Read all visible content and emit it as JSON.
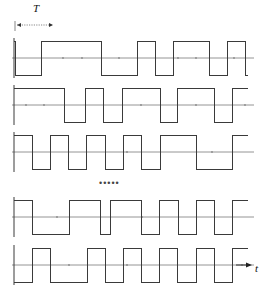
{
  "figure": {
    "name": "square-wave-timing-diagram",
    "period_label": "T",
    "time_axis_label": "t",
    "ellipsis": "•••••",
    "stroke_color": "#3a3a3a",
    "axis_color": "#7a7a7a",
    "background": "#ffffff",
    "x_start": 14,
    "x_end": 248,
    "period_px": 18,
    "amplitude_px": 17
  },
  "chart_data": {
    "type": "line",
    "title": "",
    "xlabel": "t",
    "ylabel": "",
    "grid": false,
    "legend": null,
    "annotations": [
      {
        "text": "T",
        "x": 36,
        "y": 8,
        "kind": "period-marker"
      },
      {
        "text": "•••••",
        "x": 110,
        "y": 185,
        "kind": "continuation"
      },
      {
        "text": "t",
        "x": 258,
        "y": 266,
        "kind": "axis-label"
      }
    ],
    "series": [
      {
        "name": "waveform-1",
        "baseline_y": 58,
        "start_level": 1,
        "transitions": [
          14,
          15,
          41,
          101,
          137,
          155,
          173,
          209,
          227,
          245
        ],
        "levels": [
          1,
          -1,
          1,
          -1,
          1,
          -1,
          1,
          -1,
          1,
          -1
        ],
        "axis_dots_x": [
          63,
          82,
          119,
          178,
          196,
          234
        ]
      },
      {
        "name": "waveform-2",
        "baseline_y": 105,
        "start_level": 1,
        "transitions": [
          14,
          64,
          85,
          103,
          122,
          160,
          177,
          214,
          232
        ],
        "levels": [
          1,
          -1,
          1,
          -1,
          1,
          -1,
          1,
          -1,
          1
        ],
        "axis_dots_x": [
          26,
          44,
          141,
          196,
          245
        ]
      },
      {
        "name": "waveform-3",
        "baseline_y": 152,
        "start_level": 1,
        "transitions": [
          14,
          32,
          50,
          68,
          86,
          105,
          123,
          141,
          160,
          196,
          232
        ],
        "levels": [
          1,
          -1,
          1,
          -1,
          1,
          -1,
          1,
          -1,
          1,
          -1,
          1
        ],
        "axis_dots_x": [
          127,
          212
        ]
      },
      {
        "name": "waveform-4",
        "baseline_y": 217,
        "start_level": 1,
        "transitions": [
          14,
          32,
          69,
          100,
          110,
          141,
          159,
          178,
          196,
          214,
          232
        ],
        "levels": [
          1,
          -1,
          1,
          -1,
          1,
          -1,
          1,
          -1,
          1,
          -1,
          1
        ],
        "axis_dots_x": [
          57,
          142
        ]
      },
      {
        "name": "waveform-5",
        "baseline_y": 265,
        "start_level": -1,
        "transitions": [
          14,
          32,
          50,
          87,
          105,
          123,
          141,
          159,
          177,
          196,
          214,
          232
        ],
        "levels": [
          -1,
          1,
          -1,
          1,
          -1,
          1,
          -1,
          1,
          -1,
          1,
          -1,
          1
        ],
        "axis_dots_x": [
          69,
          127,
          242
        ]
      }
    ]
  }
}
